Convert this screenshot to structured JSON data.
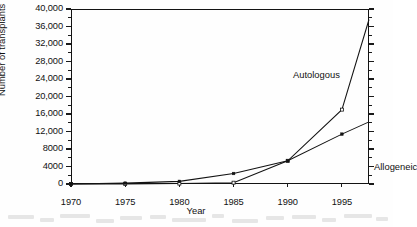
{
  "chart_data": {
    "type": "line",
    "title": "",
    "xlabel": "Year",
    "ylabel": "Number of transplants",
    "xlim": [
      1970,
      1997.5
    ],
    "ylim": [
      0,
      40000
    ],
    "grid": false,
    "legend_position": "inline-annotation",
    "x_ticks": [
      1970,
      1975,
      1980,
      1985,
      1990,
      1995
    ],
    "x_ticklabels": [
      "1970",
      "1975",
      "1980",
      "1985",
      "1990",
      "1995"
    ],
    "y_ticks": [
      0,
      4000,
      8000,
      12000,
      16000,
      20000,
      24000,
      28000,
      32000,
      36000,
      40000
    ],
    "y_ticklabels": [
      "0",
      "4000",
      "8000",
      "12,000",
      "16,000",
      "20,000",
      "24,000",
      "28,000",
      "32,000",
      "36,000",
      "40,000"
    ],
    "y_minor_ticks": [
      2000,
      6000,
      10000,
      14000,
      18000,
      22000,
      26000,
      30000,
      34000,
      38000
    ],
    "series": [
      {
        "name": "Autologous",
        "marker": "open-square",
        "annotation": "Autologous",
        "x": [
          1970,
          1975,
          1980,
          1985,
          1990,
          1995,
          1997.5
        ],
        "values": [
          0,
          0,
          100,
          300,
          5300,
          17000,
          37600
        ]
      },
      {
        "name": "Allogeneic",
        "marker": "filled-square",
        "annotation": "Allogeneic",
        "x": [
          1970,
          1975,
          1980,
          1985,
          1990,
          1995,
          1997.5
        ],
        "values": [
          0,
          200,
          600,
          2400,
          5300,
          11400,
          14200
        ]
      }
    ]
  },
  "axes": {
    "y_title": "Number of transplants",
    "x_title": "Year"
  },
  "annotations": {
    "autologous": "Autologous",
    "allogeneic": "Allogeneic"
  },
  "colors": {
    "line": "#131313",
    "axis": "#131313",
    "text": "#111111",
    "background": "#ffffff"
  }
}
